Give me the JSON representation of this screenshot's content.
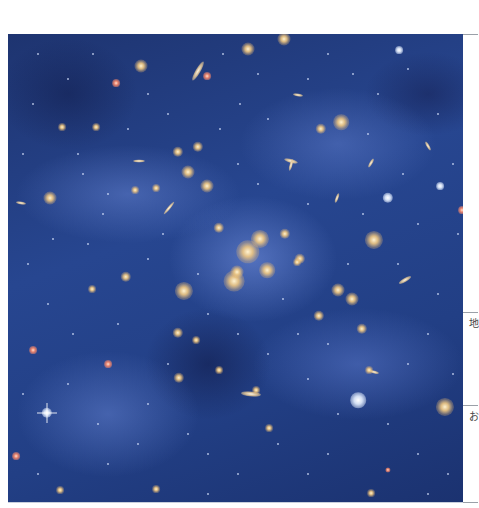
{
  "figure": {
    "colors": {
      "background": "#274690",
      "haze": "#7896e6",
      "galaxy_core": "#fff2d0",
      "galaxy_glow": "#e8b870",
      "star": "#ffffff",
      "red_star": "#ff8a6a"
    },
    "objects": [
      {
        "x": 240,
        "y": 218,
        "r": 9,
        "type": "galaxy"
      },
      {
        "x": 252,
        "y": 205,
        "r": 7,
        "type": "galaxy"
      },
      {
        "x": 226,
        "y": 247,
        "r": 8,
        "type": "galaxy"
      },
      {
        "x": 259,
        "y": 236,
        "r": 6,
        "type": "galaxy"
      },
      {
        "x": 176,
        "y": 257,
        "r": 7,
        "type": "galaxy"
      },
      {
        "x": 229,
        "y": 238,
        "r": 5,
        "type": "galaxy"
      },
      {
        "x": 211,
        "y": 194,
        "r": 4,
        "type": "galaxy"
      },
      {
        "x": 277,
        "y": 200,
        "r": 4,
        "type": "galaxy"
      },
      {
        "x": 292,
        "y": 225,
        "r": 4,
        "type": "galaxy"
      },
      {
        "x": 180,
        "y": 138,
        "r": 5,
        "type": "galaxy"
      },
      {
        "x": 199,
        "y": 152,
        "r": 5,
        "type": "galaxy"
      },
      {
        "x": 170,
        "y": 118,
        "r": 4,
        "type": "galaxy"
      },
      {
        "x": 190,
        "y": 113,
        "r": 4,
        "type": "galaxy"
      },
      {
        "x": 133,
        "y": 32,
        "r": 5,
        "type": "galaxy"
      },
      {
        "x": 276,
        "y": 5,
        "r": 5,
        "type": "galaxy"
      },
      {
        "x": 240,
        "y": 15,
        "r": 5,
        "type": "galaxy"
      },
      {
        "x": 333,
        "y": 88,
        "r": 6,
        "type": "galaxy"
      },
      {
        "x": 313,
        "y": 95,
        "r": 4,
        "type": "galaxy"
      },
      {
        "x": 42,
        "y": 164,
        "r": 5,
        "type": "galaxy"
      },
      {
        "x": 88,
        "y": 93,
        "r": 3,
        "type": "galaxy"
      },
      {
        "x": 54,
        "y": 93,
        "r": 3,
        "type": "galaxy"
      },
      {
        "x": 127,
        "y": 156,
        "r": 3,
        "type": "galaxy"
      },
      {
        "x": 148,
        "y": 154,
        "r": 3,
        "type": "galaxy"
      },
      {
        "x": 289,
        "y": 228,
        "r": 3,
        "type": "galaxy"
      },
      {
        "x": 330,
        "y": 256,
        "r": 5,
        "type": "galaxy"
      },
      {
        "x": 344,
        "y": 265,
        "r": 5,
        "type": "galaxy"
      },
      {
        "x": 366,
        "y": 206,
        "r": 7,
        "type": "galaxy"
      },
      {
        "x": 437,
        "y": 373,
        "r": 7,
        "type": "galaxy"
      },
      {
        "x": 350,
        "y": 366,
        "r": 6,
        "type": "star"
      },
      {
        "x": 354,
        "y": 295,
        "r": 4,
        "type": "galaxy"
      },
      {
        "x": 311,
        "y": 282,
        "r": 4,
        "type": "galaxy"
      },
      {
        "x": 361,
        "y": 336,
        "r": 3,
        "type": "galaxy"
      },
      {
        "x": 248,
        "y": 356,
        "r": 3,
        "type": "galaxy"
      },
      {
        "x": 261,
        "y": 394,
        "r": 3,
        "type": "galaxy"
      },
      {
        "x": 118,
        "y": 243,
        "r": 4,
        "type": "galaxy"
      },
      {
        "x": 170,
        "y": 299,
        "r": 4,
        "type": "galaxy"
      },
      {
        "x": 188,
        "y": 306,
        "r": 3,
        "type": "galaxy"
      },
      {
        "x": 211,
        "y": 336,
        "r": 3,
        "type": "galaxy"
      },
      {
        "x": 171,
        "y": 344,
        "r": 4,
        "type": "galaxy"
      },
      {
        "x": 84,
        "y": 255,
        "r": 3,
        "type": "galaxy"
      },
      {
        "x": 52,
        "y": 456,
        "r": 3,
        "type": "galaxy"
      },
      {
        "x": 148,
        "y": 455,
        "r": 3,
        "type": "galaxy"
      },
      {
        "x": 363,
        "y": 459,
        "r": 3,
        "type": "galaxy"
      },
      {
        "x": 391,
        "y": 16,
        "r": 3,
        "type": "star"
      },
      {
        "x": 432,
        "y": 152,
        "r": 3,
        "type": "star"
      },
      {
        "x": 380,
        "y": 164,
        "r": 4,
        "type": "star"
      },
      {
        "x": 39,
        "y": 379,
        "r": 4,
        "type": "spike-star"
      },
      {
        "x": 25,
        "y": 316,
        "r": 3,
        "type": "red"
      },
      {
        "x": 108,
        "y": 49,
        "r": 3,
        "type": "red"
      },
      {
        "x": 199,
        "y": 42,
        "r": 3,
        "type": "red"
      },
      {
        "x": 454,
        "y": 176,
        "r": 3,
        "type": "red"
      },
      {
        "x": 100,
        "y": 330,
        "r": 3,
        "type": "red"
      },
      {
        "x": 8,
        "y": 422,
        "r": 3,
        "type": "red"
      },
      {
        "x": 159,
        "y": 476,
        "r": 2,
        "type": "red"
      },
      {
        "x": 380,
        "y": 436,
        "r": 2,
        "type": "red"
      }
    ],
    "elongated": [
      {
        "x": 190,
        "y": 37,
        "w": 22,
        "h": 5,
        "rot": -60
      },
      {
        "x": 290,
        "y": 61,
        "w": 10,
        "h": 3,
        "rot": 10
      },
      {
        "x": 283,
        "y": 127,
        "w": 14,
        "h": 4,
        "rot": 15
      },
      {
        "x": 283,
        "y": 131,
        "w": 12,
        "h": 3,
        "rot": -75
      },
      {
        "x": 243,
        "y": 360,
        "w": 20,
        "h": 5,
        "rot": 5
      },
      {
        "x": 397,
        "y": 246,
        "w": 14,
        "h": 4,
        "rot": -30
      },
      {
        "x": 161,
        "y": 174,
        "w": 16,
        "h": 3,
        "rot": -50
      },
      {
        "x": 131,
        "y": 127,
        "w": 12,
        "h": 3,
        "rot": 0
      },
      {
        "x": 13,
        "y": 169,
        "w": 10,
        "h": 3,
        "rot": 10
      },
      {
        "x": 363,
        "y": 129,
        "w": 10,
        "h": 3,
        "rot": -60
      },
      {
        "x": 329,
        "y": 164,
        "w": 10,
        "h": 3,
        "rot": -70
      },
      {
        "x": 366,
        "y": 338,
        "w": 10,
        "h": 3,
        "rot": 15
      },
      {
        "x": 420,
        "y": 112,
        "w": 10,
        "h": 3,
        "rot": 60
      }
    ],
    "faint_dots": [
      [
        30,
        20
      ],
      [
        60,
        45
      ],
      [
        75,
        140
      ],
      [
        95,
        180
      ],
      [
        20,
        230
      ],
      [
        40,
        270
      ],
      [
        65,
        300
      ],
      [
        110,
        290
      ],
      [
        140,
        225
      ],
      [
        155,
        200
      ],
      [
        212,
        95
      ],
      [
        232,
        70
      ],
      [
        260,
        85
      ],
      [
        300,
        45
      ],
      [
        345,
        40
      ],
      [
        370,
        60
      ],
      [
        400,
        35
      ],
      [
        430,
        80
      ],
      [
        445,
        130
      ],
      [
        410,
        190
      ],
      [
        390,
        230
      ],
      [
        430,
        260
      ],
      [
        420,
        300
      ],
      [
        400,
        330
      ],
      [
        380,
        390
      ],
      [
        410,
        420
      ],
      [
        440,
        440
      ],
      [
        320,
        420
      ],
      [
        300,
        440
      ],
      [
        280,
        470
      ],
      [
        230,
        440
      ],
      [
        200,
        420
      ],
      [
        180,
        400
      ],
      [
        130,
        410
      ],
      [
        100,
        430
      ],
      [
        70,
        470
      ],
      [
        30,
        440
      ],
      [
        15,
        360
      ],
      [
        60,
        350
      ],
      [
        90,
        390
      ],
      [
        140,
        370
      ],
      [
        160,
        330
      ],
      [
        200,
        280
      ],
      [
        230,
        300
      ],
      [
        260,
        320
      ],
      [
        290,
        300
      ],
      [
        320,
        310
      ],
      [
        340,
        230
      ],
      [
        355,
        180
      ],
      [
        300,
        170
      ],
      [
        250,
        150
      ],
      [
        230,
        130
      ],
      [
        160,
        80
      ],
      [
        140,
        60
      ],
      [
        120,
        95
      ],
      [
        70,
        120
      ],
      [
        45,
        205
      ],
      [
        15,
        120
      ],
      [
        25,
        70
      ],
      [
        85,
        20
      ],
      [
        215,
        20
      ],
      [
        250,
        40
      ],
      [
        320,
        20
      ],
      [
        360,
        100
      ],
      [
        395,
        140
      ],
      [
        450,
        200
      ],
      [
        445,
        340
      ],
      [
        420,
        460
      ],
      [
        340,
        480
      ],
      [
        250,
        490
      ],
      [
        200,
        460
      ],
      [
        110,
        480
      ],
      [
        20,
        490
      ],
      [
        80,
        210
      ],
      [
        100,
        160
      ],
      [
        190,
        240
      ],
      [
        275,
        265
      ],
      [
        300,
        345
      ],
      [
        330,
        380
      ],
      [
        270,
        410
      ]
    ]
  },
  "side_table": {
    "cells": [
      {
        "label": "地",
        "y": 318
      },
      {
        "label": "お",
        "y": 411
      }
    ],
    "rules": [
      34,
      312,
      405,
      502
    ]
  }
}
